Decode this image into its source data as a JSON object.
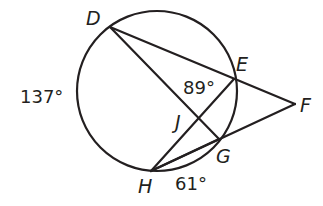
{
  "diagram": {
    "type": "circle-secants",
    "stroke_color": "#231f20",
    "background": "#ffffff",
    "circle": {
      "cx": 157,
      "cy": 91,
      "r": 80
    },
    "points": {
      "D": {
        "x": 110,
        "y": 27,
        "label": "D"
      },
      "E": {
        "x": 234,
        "y": 79,
        "label": "E"
      },
      "F": {
        "x": 295,
        "y": 104,
        "label": "F"
      },
      "G": {
        "x": 219,
        "y": 139,
        "label": "G"
      },
      "H": {
        "x": 151,
        "y": 171,
        "label": "H"
      },
      "J": {
        "x": 200,
        "y": 117,
        "label": "J"
      }
    },
    "segments": [
      [
        "D",
        "F"
      ],
      [
        "D",
        "G"
      ],
      [
        "H",
        "E"
      ],
      [
        "H",
        "F"
      ],
      [
        "H",
        "G"
      ]
    ],
    "labels": {
      "D": "D",
      "E": "E",
      "F": "F",
      "G": "G",
      "H": "H",
      "J": "J",
      "arc_DH": "137°",
      "angle_DJE": "89°",
      "arc_HG": "61°"
    }
  }
}
